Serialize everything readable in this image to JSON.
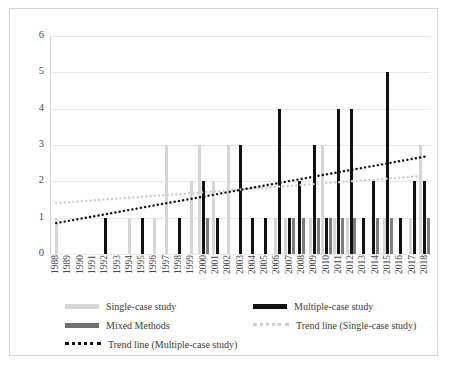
{
  "chart_data": {
    "type": "bar",
    "title": "",
    "xlabel": "",
    "ylabel": "",
    "ylim": [
      0,
      6
    ],
    "yticks": [
      0,
      1,
      2,
      3,
      4,
      5,
      6
    ],
    "grid": true,
    "legend_position": "bottom",
    "categories": [
      "1988",
      "1989",
      "1990",
      "1991",
      "1992",
      "1993",
      "1994",
      "1995",
      "1996",
      "1997",
      "1998",
      "1999",
      "2000",
      "2001",
      "2002",
      "2003",
      "2004",
      "2005",
      "2006",
      "2007",
      "2008",
      "2009",
      "2010",
      "2011",
      "2012",
      "2013",
      "2014",
      "2015",
      "2016",
      "2017",
      "2018"
    ],
    "series": [
      {
        "name": "Single-case study",
        "color": "#d6d6d6",
        "values": [
          1,
          0,
          0,
          0,
          0,
          0,
          1,
          0,
          1,
          3,
          0,
          2,
          3,
          2,
          3,
          0,
          0,
          0,
          1,
          1,
          0,
          1,
          3,
          1,
          1,
          0,
          0,
          1,
          0,
          1,
          3
        ]
      },
      {
        "name": "Multiple-case study",
        "color": "#111111",
        "values": [
          0,
          0,
          0,
          0,
          1,
          0,
          0,
          1,
          0,
          0,
          1,
          0,
          2,
          1,
          0,
          3,
          1,
          1,
          4,
          1,
          2,
          3,
          1,
          4,
          4,
          1,
          2,
          5,
          1,
          2,
          2
        ]
      },
      {
        "name": "Mixed Methods",
        "color": "#7d7d7d",
        "values": [
          0,
          0,
          0,
          0,
          0,
          0,
          0,
          0,
          0,
          0,
          0,
          0,
          1,
          0,
          0,
          0,
          0,
          0,
          0,
          1,
          1,
          1,
          1,
          1,
          1,
          0,
          1,
          1,
          0,
          0,
          1
        ]
      }
    ],
    "trend_lines": [
      {
        "name": "Trend line (Single-case study)",
        "color": "#cfcfcf",
        "style": "dotted",
        "start_value": 1.4,
        "end_value": 2.15
      },
      {
        "name": "Trend line (Multiple-case study)",
        "color": "#111111",
        "style": "dotted",
        "start_value": 0.85,
        "end_value": 2.68
      }
    ]
  },
  "legend": {
    "items": [
      {
        "label": "Single-case study",
        "swatch": "single"
      },
      {
        "label": "Multiple-case study",
        "swatch": "multiple"
      },
      {
        "label": "Mixed Methods",
        "swatch": "mixed"
      },
      {
        "label": "Trend line (Single-case study)",
        "swatch": "dotted-light"
      },
      {
        "label": "Trend line (Multiple-case study)",
        "swatch": "dotted-dark"
      }
    ]
  }
}
